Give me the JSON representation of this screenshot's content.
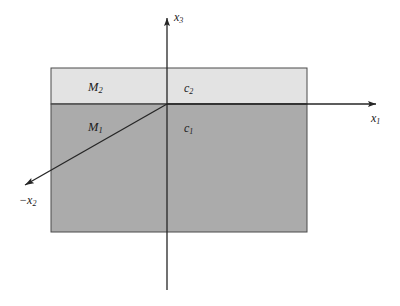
{
  "figure": {
    "type": "half-space-layered-medium-schematic",
    "background_color": "#ffffff",
    "line_color": "#262626",
    "layers": [
      {
        "id": "upper",
        "medium_label": "M",
        "medium_subscript": "2",
        "speed_label": "c",
        "speed_subscript": "2",
        "fill_color": "#e3e3e3",
        "x": 51,
        "y": 68,
        "width": 256,
        "height": 36
      },
      {
        "id": "lower",
        "medium_label": "M",
        "medium_subscript": "1",
        "speed_label": "c",
        "speed_subscript": "1",
        "fill_color": "#ababab",
        "x": 51,
        "y": 104,
        "width": 256,
        "height": 128
      }
    ],
    "axes": [
      {
        "name": "x1-axis",
        "label": "x",
        "subscript": "1",
        "direction": "right",
        "x1": 167,
        "y1": 104,
        "x2": 381,
        "y2": 104,
        "label_x": 371,
        "label_y": 112
      },
      {
        "name": "x3-axis",
        "label": "x",
        "subscript": "3",
        "direction": "up",
        "x1": 167,
        "y1": 290,
        "x2": 167,
        "y2": 14,
        "label_x": 174,
        "label_y": 12
      },
      {
        "name": "negative-x2-axis",
        "label": "−x",
        "subscript": "2",
        "direction": "down-left",
        "x1": 167,
        "y1": 104,
        "x2": 18,
        "y2": 189,
        "label_x": 19,
        "label_y": 196
      }
    ],
    "interface": {
      "name": "layer-interface",
      "y": 104,
      "x_start": 51,
      "x_end": 307
    }
  }
}
